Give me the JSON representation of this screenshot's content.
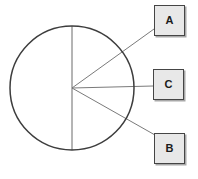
{
  "diagram": {
    "circle": {
      "cx": 72,
      "cy": 88,
      "r": 62,
      "stroke": "#3d3d3d"
    },
    "lines": {
      "stroke": "#7a7a7a",
      "vertical_diameter": {
        "x1": 72,
        "y1": 26,
        "x2": 72,
        "y2": 150
      },
      "leader_to_a": {
        "x1": 72,
        "y1": 88,
        "x2": 154,
        "y2": 29
      },
      "leader_to_c": {
        "x1": 72,
        "y1": 88,
        "x2": 153,
        "y2": 86
      },
      "leader_to_b": {
        "x1": 72,
        "y1": 88,
        "x2": 155,
        "y2": 135
      }
    },
    "boxes": [
      {
        "label": "A",
        "position": "top-right"
      },
      {
        "label": "C",
        "position": "middle-right"
      },
      {
        "label": "B",
        "position": "bottom-right"
      }
    ],
    "box_style": {
      "fill": "#e8e8e8",
      "border": "#454545",
      "text_color": "#1b1b1b"
    },
    "background": "#ffffff"
  }
}
